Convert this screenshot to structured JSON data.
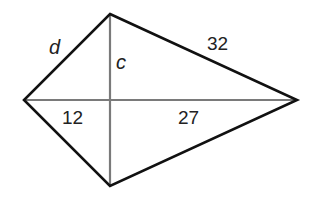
{
  "figure": {
    "type": "kite",
    "vertices": {
      "top": [
        110,
        14
      ],
      "left": [
        24,
        100
      ],
      "right": [
        297,
        100
      ],
      "bottom": [
        110,
        186
      ]
    },
    "intersection": [
      110,
      100
    ],
    "colors": {
      "sides": "#111111",
      "diagonals": "#7a7a7a",
      "text": "#222222",
      "background": "#ffffff"
    }
  },
  "labels": {
    "side_top_left": "d",
    "side_top_right": "32",
    "half_vertical_diagonal_top": "c",
    "half_horizontal_diagonal_left": "12",
    "half_horizontal_diagonal_right": "27"
  }
}
